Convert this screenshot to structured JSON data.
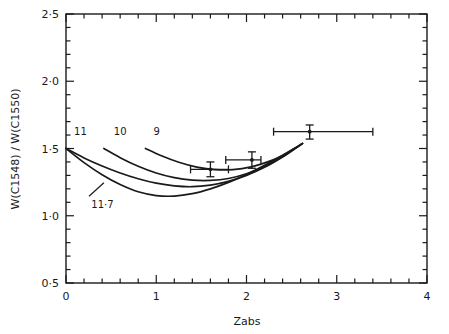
{
  "chart_data": {
    "type": "line",
    "title": "",
    "xlabel": "Zabs",
    "ylabel": "W(C1548) / W(C1550)",
    "xlim": [
      0,
      4
    ],
    "ylim": [
      0.5,
      2.5
    ],
    "grid": false,
    "legend_position": "inline-curve-labels",
    "xticks": [
      "0",
      "1",
      "2",
      "3",
      "4"
    ],
    "xtick_values": [
      0,
      1,
      2,
      3,
      4
    ],
    "xminor_step": 0.2,
    "yticks": [
      "0·5",
      "1·0",
      "1·5",
      "2·0",
      "2·5"
    ],
    "ytick_values": [
      0.5,
      1.0,
      1.5,
      2.0,
      2.5
    ],
    "yminor_step": 0.1,
    "series": [
      {
        "name": "11",
        "label": "11",
        "label_x": 0.09,
        "label_y": 1.63,
        "leader": false,
        "points": [
          [
            0.0,
            1.5
          ],
          [
            0.2,
            1.43
          ],
          [
            0.4,
            1.37
          ],
          [
            0.6,
            1.318
          ],
          [
            0.8,
            1.275
          ],
          [
            1.0,
            1.242
          ],
          [
            1.2,
            1.222
          ],
          [
            1.4,
            1.216
          ],
          [
            1.6,
            1.228
          ],
          [
            1.8,
            1.256
          ],
          [
            2.0,
            1.3
          ],
          [
            2.2,
            1.36
          ],
          [
            2.4,
            1.437
          ],
          [
            2.55,
            1.505
          ],
          [
            2.62,
            1.536
          ]
        ]
      },
      {
        "name": "11.7",
        "label": "11·7",
        "label_x": 0.28,
        "label_y": 1.09,
        "leader": true,
        "leader_from": [
          0.255,
          1.145
        ],
        "leader_to": [
          0.42,
          1.245
        ],
        "points": [
          [
            0.0,
            1.5
          ],
          [
            0.2,
            1.395
          ],
          [
            0.4,
            1.305
          ],
          [
            0.6,
            1.232
          ],
          [
            0.8,
            1.178
          ],
          [
            1.0,
            1.15
          ],
          [
            1.2,
            1.146
          ],
          [
            1.4,
            1.164
          ],
          [
            1.6,
            1.2
          ],
          [
            1.8,
            1.248
          ],
          [
            2.0,
            1.307
          ],
          [
            2.2,
            1.375
          ],
          [
            2.4,
            1.45
          ],
          [
            2.55,
            1.508
          ],
          [
            2.62,
            1.538
          ]
        ]
      },
      {
        "name": "10",
        "label": "10",
        "label_x": 0.53,
        "label_y": 1.63,
        "leader": false,
        "points": [
          [
            0.42,
            1.5
          ],
          [
            0.6,
            1.432
          ],
          [
            0.8,
            1.368
          ],
          [
            1.0,
            1.318
          ],
          [
            1.2,
            1.283
          ],
          [
            1.4,
            1.265
          ],
          [
            1.6,
            1.263
          ],
          [
            1.8,
            1.277
          ],
          [
            2.0,
            1.312
          ],
          [
            2.2,
            1.368
          ],
          [
            2.4,
            1.44
          ],
          [
            2.55,
            1.505
          ],
          [
            2.62,
            1.536
          ]
        ]
      },
      {
        "name": "9",
        "label": "9",
        "label_x": 0.97,
        "label_y": 1.63,
        "leader": false,
        "points": [
          [
            0.88,
            1.5
          ],
          [
            1.05,
            1.448
          ],
          [
            1.25,
            1.398
          ],
          [
            1.45,
            1.362
          ],
          [
            1.65,
            1.343
          ],
          [
            1.85,
            1.343
          ],
          [
            2.05,
            1.363
          ],
          [
            2.25,
            1.404
          ],
          [
            2.4,
            1.448
          ],
          [
            2.55,
            1.508
          ],
          [
            2.62,
            1.538
          ]
        ]
      }
    ],
    "data_points": [
      {
        "name": "point-1",
        "x": 1.6,
        "y": 1.345,
        "xerr_low": 0.22,
        "xerr_high": 0.2,
        "yerr_low": 0.055,
        "yerr_high": 0.055
      },
      {
        "name": "point-2",
        "x": 2.06,
        "y": 1.415,
        "xerr_low": 0.29,
        "xerr_high": 0.1,
        "yerr_low": 0.062,
        "yerr_high": 0.06
      },
      {
        "name": "point-3",
        "x": 2.7,
        "y": 1.625,
        "xerr_low": 0.4,
        "xerr_high": 0.7,
        "yerr_low": 0.055,
        "yerr_high": 0.05
      }
    ]
  },
  "axes": {
    "x_label": "Zabs",
    "y_label": "W(C1548) / W(C1550)"
  }
}
